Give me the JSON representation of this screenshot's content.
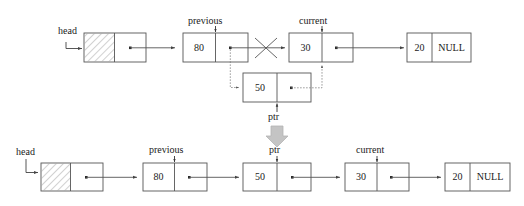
{
  "diagram": {
    "title_text": "",
    "stroke_color": "#555555",
    "text_color": "#1a1a1a",
    "gray_arrow_color": "#bfbfbf",
    "hatch_color": "#999999"
  },
  "top_row": {
    "pointer_labels": {
      "head": "head",
      "previous": "previous",
      "current": "current",
      "ptr": "ptr"
    },
    "nodes": [
      {
        "name": "head-node",
        "data": "",
        "next": "dot",
        "hatched": true
      },
      {
        "name": "node-80",
        "data": "80",
        "next": "dot",
        "hatched": false
      },
      {
        "name": "node-30",
        "data": "30",
        "next": "dot",
        "hatched": false
      },
      {
        "name": "node-20",
        "data": "20",
        "next": "NULL",
        "hatched": false
      },
      {
        "name": "node-50-new",
        "data": "50",
        "next": "dot",
        "hatched": false
      }
    ]
  },
  "bottom_row": {
    "pointer_labels": {
      "head": "head",
      "previous": "previous",
      "ptr": "ptr",
      "current": "current"
    },
    "nodes": [
      {
        "name": "head-node",
        "data": "",
        "next": "dot",
        "hatched": true
      },
      {
        "name": "node-80",
        "data": "80",
        "next": "dot",
        "hatched": false
      },
      {
        "name": "node-50",
        "data": "50",
        "next": "dot",
        "hatched": false
      },
      {
        "name": "node-30",
        "data": "30",
        "next": "dot",
        "hatched": false
      },
      {
        "name": "node-20",
        "data": "20",
        "next": "NULL",
        "hatched": false
      }
    ]
  },
  "transition": {
    "arrow_name": "gray-down-arrow",
    "label": "ptr"
  }
}
